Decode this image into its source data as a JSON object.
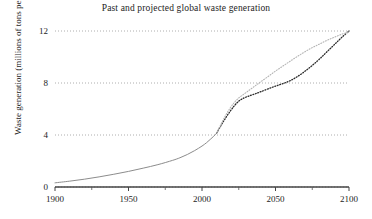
{
  "chart_data": {
    "type": "line",
    "title": "Past and projected global waste generation",
    "xlabel": "",
    "ylabel": "Waste generation (millions of tons per day)",
    "xlim": [
      1900,
      2100
    ],
    "ylim": [
      0,
      12.6
    ],
    "grid": true,
    "grid_style": "dotted-horizontal",
    "legend": "none",
    "yticks": [
      0,
      4,
      8,
      12
    ],
    "ytick_labels": [
      "0",
      "4",
      "8",
      "12"
    ],
    "xticks": [
      1900,
      1950,
      2000,
      2050,
      2100
    ],
    "xtick_labels": [
      "1900",
      "1950",
      "2000",
      "2050",
      "2100"
    ],
    "xminor_ticks": [
      1925,
      1975,
      2025,
      2075
    ],
    "series": [
      {
        "name": "historical",
        "style": "solid",
        "color": "#8c8c8c",
        "width": 1.0,
        "x": [
          1900,
          1910,
          1920,
          1930,
          1940,
          1950,
          1960,
          1970,
          1980,
          1985,
          1990,
          1995,
          2000,
          2003,
          2006,
          2009,
          2010
        ],
        "values": [
          0.32,
          0.45,
          0.6,
          0.78,
          0.98,
          1.2,
          1.45,
          1.72,
          2.05,
          2.25,
          2.5,
          2.8,
          3.15,
          3.4,
          3.7,
          4.02,
          4.15
        ]
      },
      {
        "name": "projection-low",
        "style": "dotted",
        "color": "#2b2b2b",
        "width": 1.3,
        "x": [
          2010,
          2013,
          2016,
          2019,
          2022,
          2025,
          2028,
          2031,
          2034,
          2037,
          2040,
          2045,
          2050,
          2055,
          2060,
          2065,
          2070,
          2075,
          2080,
          2085,
          2090,
          2095,
          2100
        ],
        "values": [
          4.15,
          4.75,
          5.3,
          5.8,
          6.25,
          6.6,
          6.82,
          6.96,
          7.08,
          7.2,
          7.33,
          7.55,
          7.76,
          7.95,
          8.18,
          8.5,
          8.9,
          9.35,
          9.85,
          10.4,
          10.95,
          11.5,
          12.0
        ]
      },
      {
        "name": "projection-high",
        "style": "dotted",
        "color": "#b4b4b4",
        "width": 1.1,
        "x": [
          2010,
          2013,
          2016,
          2019,
          2022,
          2025,
          2028,
          2031,
          2034,
          2037,
          2040,
          2045,
          2050,
          2055,
          2060,
          2065,
          2070,
          2075,
          2080,
          2085,
          2090,
          2095,
          2100
        ],
        "values": [
          4.15,
          4.85,
          5.5,
          6.05,
          6.5,
          6.85,
          7.1,
          7.35,
          7.6,
          7.85,
          8.1,
          8.5,
          8.92,
          9.3,
          9.68,
          10.05,
          10.4,
          10.72,
          11.0,
          11.28,
          11.52,
          11.75,
          11.92
        ]
      }
    ]
  }
}
